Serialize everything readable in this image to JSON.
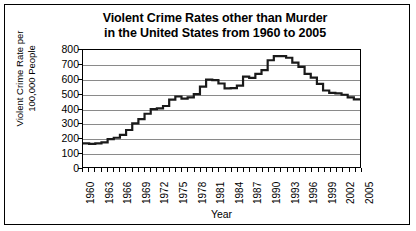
{
  "chart_data": {
    "type": "line",
    "title": "Violent Crime Rates other than Murder in the United States from 1960 to 2005",
    "title_line1": "Violent Crime Rates other than Murder",
    "title_line2": "in the United States from 1960 to 2005",
    "xlabel": "Year",
    "ylabel": "Violent Crime Rate per 100,000 People",
    "ylabel_line1": "Violent Crime Rate per",
    "ylabel_line2": "100,000 People",
    "ylim": [
      0,
      800
    ],
    "yticks": [
      0,
      100,
      200,
      300,
      400,
      500,
      600,
      700,
      800
    ],
    "ytick_labels": [
      "0",
      "100",
      "200",
      "300",
      "400",
      "500",
      "600",
      "700",
      "800"
    ],
    "xlim": [
      1960,
      2005
    ],
    "xticks": [
      1960,
      1963,
      1966,
      1969,
      1972,
      1975,
      1978,
      1981,
      1984,
      1987,
      1990,
      1993,
      1996,
      1999,
      2002,
      2005
    ],
    "xtick_labels": [
      "1960",
      "1963",
      "1966",
      "1969",
      "1972",
      "1975",
      "1978",
      "1981",
      "1984",
      "1987",
      "1990",
      "1993",
      "1996",
      "1999",
      "2002",
      "2005"
    ],
    "grid": true,
    "grid_axis": "y",
    "legend": false,
    "line_color": "#1a1a1a",
    "grid_color": "#8a8a8a",
    "background_color": "#ffffff",
    "x": [
      1960,
      1961,
      1962,
      1963,
      1964,
      1965,
      1966,
      1967,
      1968,
      1969,
      1970,
      1971,
      1972,
      1973,
      1974,
      1975,
      1976,
      1977,
      1978,
      1979,
      1980,
      1981,
      1982,
      1983,
      1984,
      1985,
      1986,
      1987,
      1988,
      1989,
      1990,
      1991,
      1992,
      1993,
      1994,
      1995,
      1996,
      1997,
      1998,
      1999,
      2000,
      2001,
      2002,
      2003,
      2004,
      2005
    ],
    "values": [
      161,
      158,
      162,
      168,
      190,
      200,
      220,
      253,
      298,
      328,
      364,
      396,
      401,
      417,
      461,
      482,
      468,
      476,
      498,
      549,
      597,
      594,
      571,
      538,
      539,
      557,
      618,
      610,
      637,
      663,
      730,
      758,
      758,
      747,
      714,
      685,
      637,
      611,
      568,
      523,
      507,
      504,
      494,
      476,
      463,
      469
    ],
    "series": [
      {
        "name": "Violent Crime Rate",
        "values": [
          161,
          158,
          162,
          168,
          190,
          200,
          220,
          253,
          298,
          328,
          364,
          396,
          401,
          417,
          461,
          482,
          468,
          476,
          498,
          549,
          597,
          594,
          571,
          538,
          539,
          557,
          618,
          610,
          637,
          663,
          730,
          758,
          758,
          747,
          714,
          685,
          637,
          611,
          568,
          523,
          507,
          504,
          494,
          476,
          463,
          469
        ]
      }
    ]
  }
}
